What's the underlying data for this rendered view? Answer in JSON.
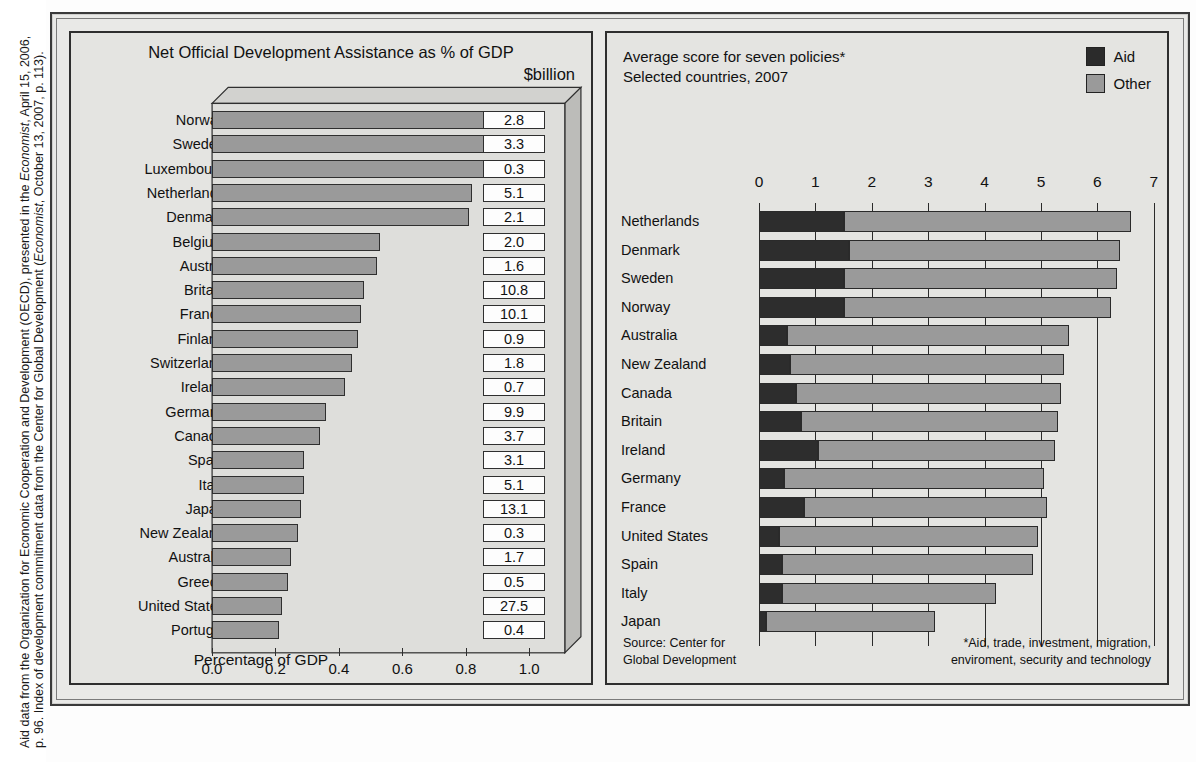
{
  "caption": {
    "line1_a": "Aid data from the Organization for Economic Cooperation and Development (OECD), presented in the ",
    "line1_b": "Economist",
    "line1_c": ", April 15, 2006,",
    "line2_a": "p. 96. Index of development commitment data from the Center for Global Development (",
    "line2_b": "Economist",
    "line2_c": ", October 13, 2007, p. 113)."
  },
  "left_panel": {
    "title": "Net Official Development Assistance as % of GDP",
    "value_header": "$billion",
    "axis_title": "Percentage of GDP"
  },
  "right_panel": {
    "title_line1": "Average score for seven policies*",
    "title_line2": "Selected countries, 2007",
    "legend": [
      {
        "label": "Aid",
        "color": "#2b2b2b",
        "name": "aid"
      },
      {
        "label": "Other",
        "color": "#9a9a9a",
        "name": "other"
      }
    ],
    "source": "Source: Center for\nGlobal Development",
    "source_line1": "Source: Center for",
    "source_line2": "Global Development",
    "note_line1": "*Aid, trade, investment, migration,",
    "note_line2": "enviroment, security and technology"
  },
  "chart_data": [
    {
      "id": "oda-share",
      "type": "bar",
      "orientation": "horizontal",
      "title": "Net Official Development Assistance as % of GDP",
      "xlabel": "Percentage of GDP",
      "ylabel": "",
      "xlim": [
        0.0,
        1.1
      ],
      "xticks": [
        0.0,
        0.2,
        0.4,
        0.6,
        0.8,
        1.0
      ],
      "xtick_labels": [
        "0.0",
        "0.2",
        "0.4",
        "0.6",
        "0.8",
        "1.0"
      ],
      "grid": false,
      "legend": false,
      "value_column_header": "$billion",
      "bar_color": "#9a9a9a",
      "categories": [
        "Norway",
        "Sweden",
        "Luxembourg",
        "Netherlands",
        "Denmark",
        "Belgium",
        "Austria",
        "Britain",
        "France",
        "Finland",
        "Switzerland",
        "Ireland",
        "Germany",
        "Canada",
        "Spain",
        "Italy",
        "Japan",
        "New Zealand",
        "Australia",
        "Greece",
        "United States",
        "Portugal"
      ],
      "values": [
        0.94,
        0.94,
        0.87,
        0.82,
        0.81,
        0.53,
        0.52,
        0.48,
        0.47,
        0.46,
        0.44,
        0.42,
        0.36,
        0.34,
        0.29,
        0.29,
        0.28,
        0.27,
        0.25,
        0.24,
        0.22,
        0.21
      ],
      "value_labels": [
        "2.8",
        "3.3",
        "0.3",
        "5.1",
        "2.1",
        "2.0",
        "1.6",
        "10.8",
        "10.1",
        "0.9",
        "1.8",
        "0.7",
        "9.9",
        "3.7",
        "3.1",
        "5.1",
        "13.1",
        "0.3",
        "1.7",
        "0.5",
        "27.5",
        "0.4"
      ]
    },
    {
      "id": "commitment-index",
      "type": "bar",
      "orientation": "horizontal",
      "stacked": true,
      "title": "Average score for seven policies*",
      "subtitle": "Selected countries, 2007",
      "xlabel": "",
      "ylabel": "",
      "xlim": [
        0,
        7
      ],
      "xticks": [
        0,
        1,
        2,
        3,
        4,
        5,
        6,
        7
      ],
      "xtick_labels": [
        "0",
        "1",
        "2",
        "3",
        "4",
        "5",
        "6",
        "7"
      ],
      "grid": false,
      "legend_position": "top-right",
      "categories": [
        "Netherlands",
        "Denmark",
        "Sweden",
        "Norway",
        "Australia",
        "New Zealand",
        "Canada",
        "Britain",
        "Ireland",
        "Germany",
        "France",
        "United States",
        "Spain",
        "Italy",
        "Japan"
      ],
      "series": [
        {
          "name": "Aid",
          "color": "#2b2b2b",
          "values": [
            1.5,
            1.6,
            1.5,
            1.5,
            0.5,
            0.55,
            0.65,
            0.75,
            1.05,
            0.45,
            0.8,
            0.35,
            0.4,
            0.4,
            0.12
          ]
        },
        {
          "name": "Other",
          "color": "#9a9a9a",
          "values": [
            5.1,
            4.8,
            4.85,
            4.75,
            5.0,
            4.85,
            4.7,
            4.55,
            4.2,
            4.6,
            4.3,
            4.6,
            4.45,
            3.8,
            3.0
          ]
        }
      ],
      "totals": [
        6.6,
        6.4,
        6.35,
        6.25,
        5.5,
        5.4,
        5.35,
        5.3,
        5.25,
        5.05,
        5.1,
        4.95,
        4.85,
        4.2,
        3.12
      ]
    }
  ]
}
